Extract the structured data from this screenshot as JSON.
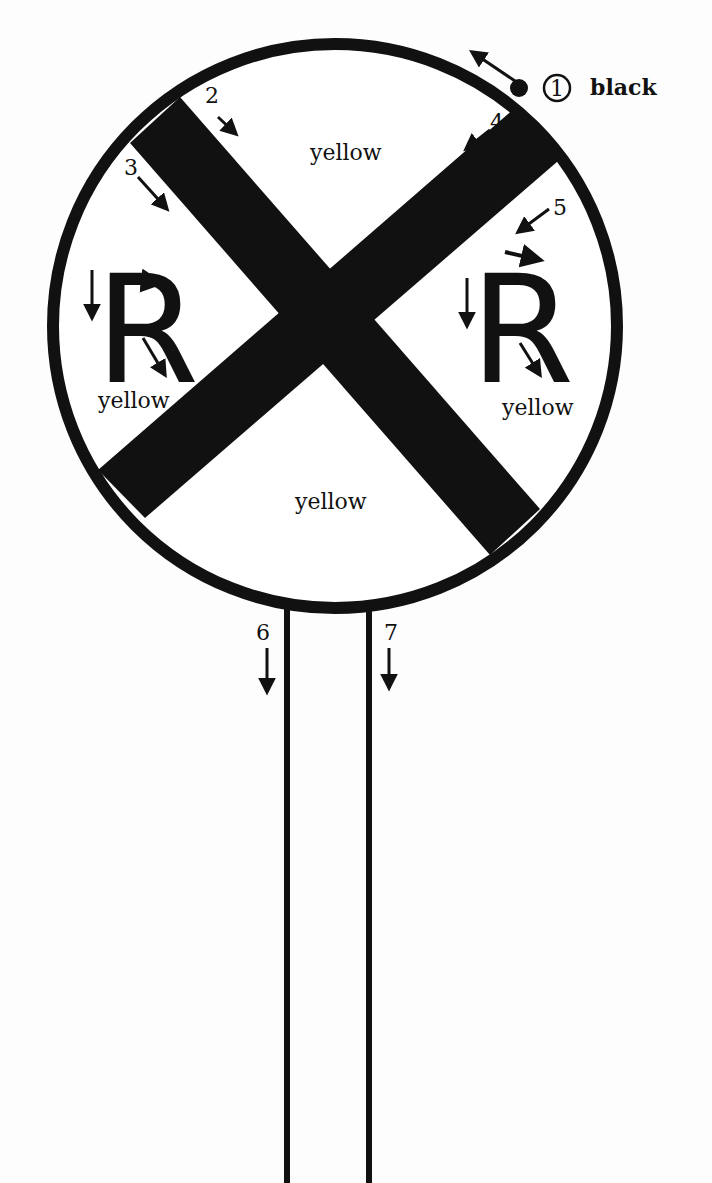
{
  "diagram": {
    "colors": {
      "ink": "#111111",
      "background": "#fdfdfd"
    },
    "legend": {
      "step1_number": "1",
      "step1_color": "black"
    },
    "regions": {
      "top": "yellow",
      "left": "yellow",
      "right": "yellow",
      "bottom": "yellow"
    },
    "letters": {
      "left": "R",
      "right": "R"
    },
    "steps": [
      {
        "number": "1",
        "target": "outer rim",
        "color": "black"
      },
      {
        "number": "2",
        "target": "top-left band, upper edge"
      },
      {
        "number": "3",
        "target": "top-left band, lower edge"
      },
      {
        "number": "4",
        "target": "top-right band, upper edge"
      },
      {
        "number": "5",
        "target": "top-right band, lower edge"
      },
      {
        "number": "6",
        "target": "left post"
      },
      {
        "number": "7",
        "target": "right post"
      }
    ]
  }
}
